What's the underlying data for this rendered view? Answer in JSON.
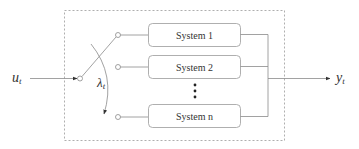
{
  "diagram": {
    "input_label": "u",
    "input_subscript": "t",
    "output_label": "y",
    "output_subscript": "t",
    "switch_label": "λ",
    "switch_subscript": "t",
    "systems": [
      {
        "label": "System 1"
      },
      {
        "label": "System 2"
      },
      {
        "label": "System n"
      }
    ],
    "ellipsis": "⋮",
    "colors": {
      "stroke": "#8a8a8a",
      "box_border": "#9a9a9a",
      "text": "#333333",
      "dashed_border": "#9a9a9a"
    }
  }
}
